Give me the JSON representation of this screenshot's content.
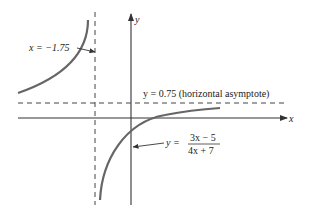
{
  "figure": {
    "axes": {
      "x_label": "x",
      "y_label": "y"
    },
    "vertical_asymptote": {
      "label": "x = −1.75",
      "value": -1.75
    },
    "horizontal_asymptote": {
      "label": "y = 0.75 (horizontal asymptote)",
      "value": 0.75
    },
    "function": {
      "lhs": "y =",
      "numerator": "3x − 5",
      "denominator": "4x + 7"
    },
    "colors": {
      "curve": "#666666",
      "axes": "#333333",
      "asymptote": "#444444",
      "text": "#222222"
    }
  }
}
